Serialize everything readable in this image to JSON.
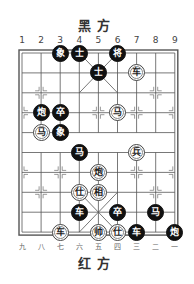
{
  "titles": {
    "top": "黑方",
    "bottom": "红方"
  },
  "file_labels": {
    "top": [
      "1",
      "2",
      "3",
      "4",
      "5",
      "6",
      "7",
      "8",
      "9"
    ],
    "bottom": [
      "九",
      "八",
      "七",
      "六",
      "五",
      "四",
      "三",
      "二",
      "一"
    ]
  },
  "colors": {
    "black_piece": "#111111",
    "red_piece_bg": "#ffffff",
    "grid": "#555555"
  },
  "pieces": [
    {
      "side": "black",
      "char": "象",
      "file": 3,
      "rank": 0
    },
    {
      "side": "black",
      "char": "士",
      "file": 4,
      "rank": 0
    },
    {
      "side": "black",
      "char": "将",
      "file": 6,
      "rank": 0
    },
    {
      "side": "black",
      "char": "士",
      "file": 5,
      "rank": 1
    },
    {
      "side": "red",
      "char": "车",
      "file": 7,
      "rank": 1
    },
    {
      "side": "black",
      "char": "炮",
      "file": 2,
      "rank": 3
    },
    {
      "side": "black",
      "char": "卒",
      "file": 3,
      "rank": 3
    },
    {
      "side": "red",
      "char": "马",
      "file": 6,
      "rank": 3
    },
    {
      "side": "red",
      "char": "马",
      "file": 2,
      "rank": 4
    },
    {
      "side": "black",
      "char": "象",
      "file": 3,
      "rank": 4
    },
    {
      "side": "black",
      "char": "马",
      "file": 4,
      "rank": 5
    },
    {
      "side": "red",
      "char": "兵",
      "file": 7,
      "rank": 5
    },
    {
      "side": "red",
      "char": "炮",
      "file": 5,
      "rank": 6
    },
    {
      "side": "red",
      "char": "仕",
      "file": 4,
      "rank": 7
    },
    {
      "side": "red",
      "char": "相",
      "file": 5,
      "rank": 7
    },
    {
      "side": "black",
      "char": "车",
      "file": 4,
      "rank": 8
    },
    {
      "side": "black",
      "char": "卒",
      "file": 6,
      "rank": 8
    },
    {
      "side": "black",
      "char": "马",
      "file": 8,
      "rank": 8
    },
    {
      "side": "red",
      "char": "车",
      "file": 3,
      "rank": 9
    },
    {
      "side": "red",
      "char": "帅",
      "file": 5,
      "rank": 9
    },
    {
      "side": "red",
      "char": "仕",
      "file": 6,
      "rank": 9
    },
    {
      "side": "black",
      "char": "车",
      "file": 7,
      "rank": 9
    },
    {
      "side": "black",
      "char": "炮",
      "file": 9,
      "rank": 9
    }
  ]
}
